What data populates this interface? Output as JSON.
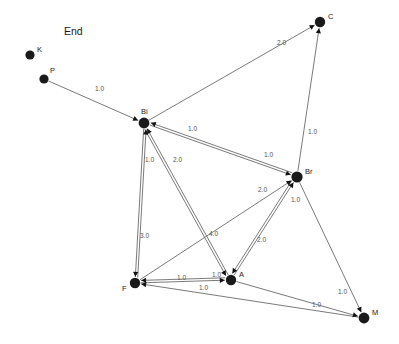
{
  "canvas": {
    "width": 399,
    "height": 344,
    "background": "#ffffff",
    "title": "End"
  },
  "style": {
    "node_color": "#1a1a1a",
    "edge_color": "#6b6b6b",
    "arrow_color": "#111111",
    "node_label_color": "#1a1a1a",
    "edge_label_color": "#555555"
  },
  "graph": {
    "type": "directed-weighted-graph",
    "nodes": [
      {
        "id": "K",
        "label": "K",
        "x": 30,
        "y": 55,
        "r": 4.6,
        "label_dx": 7,
        "label_dy": -3
      },
      {
        "id": "P",
        "label": "P",
        "x": 44,
        "y": 79,
        "r": 4.6,
        "label_dx": 6,
        "label_dy": -6
      },
      {
        "id": "C",
        "label": "C",
        "x": 320,
        "y": 22,
        "r": 5.2,
        "label_dx": 8,
        "label_dy": -3
      },
      {
        "id": "Bi",
        "label": "Bi",
        "x": 144,
        "y": 123,
        "r": 5.4,
        "label_dx": -3,
        "label_dy": -9
      },
      {
        "id": "Br",
        "label": "Br",
        "x": 297,
        "y": 177,
        "r": 5.6,
        "label_dx": 8,
        "label_dy": -3
      },
      {
        "id": "F",
        "label": "F",
        "x": 135,
        "y": 283,
        "r": 5.2,
        "label_dx": -13,
        "label_dy": 8
      },
      {
        "id": "A",
        "label": "A",
        "x": 231,
        "y": 280,
        "r": 5.2,
        "label_dx": 8,
        "label_dy": -3
      },
      {
        "id": "M",
        "label": "M",
        "x": 364,
        "y": 318,
        "r": 5.4,
        "label_dx": 8,
        "label_dy": -3
      }
    ],
    "edges": [
      {
        "from": "P",
        "to": "Bi",
        "weight": "1.0",
        "label_x": 95,
        "label_y": 91
      },
      {
        "from": "Bi",
        "to": "C",
        "weight": "2.0",
        "label_x": 277,
        "label_y": 45
      },
      {
        "from": "Br",
        "to": "C",
        "weight": "1.0",
        "label_x": 308,
        "label_y": 134
      },
      {
        "from": "Bi",
        "to": "Br",
        "weight": "1.0",
        "label_x": 264,
        "label_y": 157
      },
      {
        "from": "Br",
        "to": "Bi",
        "weight": "1.0",
        "label_x": 188,
        "label_y": 131
      },
      {
        "from": "Bi",
        "to": "F",
        "weight": "3.0",
        "label_x": 140,
        "label_y": 238
      },
      {
        "from": "F",
        "to": "Bi",
        "weight": "1.0",
        "label_x": 145,
        "label_y": 162
      },
      {
        "from": "A",
        "to": "Bi",
        "weight": "2.0",
        "label_x": 173,
        "label_y": 162
      },
      {
        "from": "F",
        "to": "Br",
        "weight": "2.0",
        "label_x": 258,
        "label_y": 192
      },
      {
        "from": "A",
        "to": "Br",
        "weight": "1.0",
        "label_x": 291,
        "label_y": 202
      },
      {
        "from": "Br",
        "to": "A",
        "weight": "2.0",
        "label_x": 257,
        "label_y": 242
      },
      {
        "from": "Bi",
        "to": "A",
        "weight": "4.0",
        "label_x": 209,
        "label_y": 236
      },
      {
        "from": "F",
        "to": "A",
        "weight": "1.0",
        "label_x": 212,
        "label_y": 277
      },
      {
        "from": "A",
        "to": "F",
        "weight": "1.0",
        "label_x": 177,
        "label_y": 280
      },
      {
        "from": "A",
        "to": "M",
        "weight": "1.0",
        "label_x": 312,
        "label_y": 307
      },
      {
        "from": "M",
        "to": "F",
        "weight": "1.0",
        "label_x": 199,
        "label_y": 290
      },
      {
        "from": "Br",
        "to": "M",
        "weight": "1.0",
        "label_x": 338,
        "label_y": 294
      }
    ]
  }
}
